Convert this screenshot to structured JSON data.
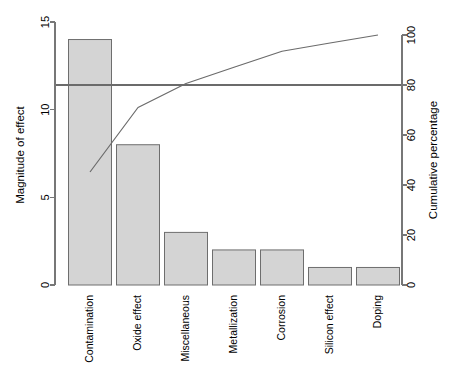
{
  "chart_data": {
    "type": "bar",
    "title": "",
    "subtitle": "",
    "xlabel": "",
    "ylabel": "Magnitude of effect",
    "y2label": "Cumulative percentage",
    "categories": [
      "Contamination",
      "Oxide effect",
      "Miscellaneous",
      "Metallization",
      "Corrosion",
      "Silicon effect",
      "Doping"
    ],
    "values": [
      14,
      8,
      3,
      2,
      2,
      1,
      1
    ],
    "cumulative_percentage": [
      45.2,
      71.0,
      80.6,
      87.1,
      93.5,
      96.8,
      100.0
    ],
    "total": 31,
    "ylim": [
      0,
      15
    ],
    "yticks": [
      0,
      5,
      10,
      15
    ],
    "ytick_labels": [
      "0",
      "5",
      "10",
      "15"
    ],
    "y2lim": [
      0,
      100
    ],
    "y2ticks": [
      0,
      20,
      40,
      60,
      80,
      100
    ],
    "y2tick_labels": [
      "0",
      "20",
      "40",
      "60",
      "80",
      "100"
    ],
    "reference_line_percentage": 80,
    "grid": false,
    "legend": "none",
    "series": [
      {
        "name": "Magnitude of effect",
        "type": "bar",
        "values": [
          14,
          8,
          3,
          2,
          2,
          1,
          1
        ]
      },
      {
        "name": "Cumulative percentage",
        "type": "line",
        "values": [
          45.2,
          71.0,
          80.6,
          87.1,
          93.5,
          96.8,
          100.0
        ]
      }
    ],
    "colors": {
      "bar_fill": "#d4d4d4",
      "bar_border": "#6e6e6e",
      "line": "#6b6b6b",
      "axis": "#777777",
      "background": "#ffffff"
    }
  }
}
